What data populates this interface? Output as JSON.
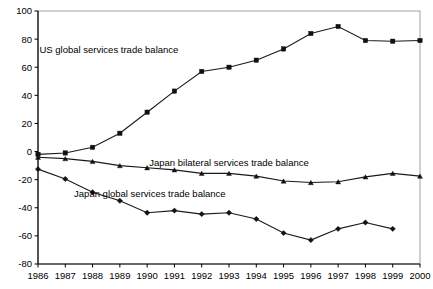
{
  "chart_data": {
    "type": "line",
    "title": "",
    "subtitle": "",
    "xlabel": "",
    "ylabel": "",
    "categories": [
      "1986",
      "1987",
      "1988",
      "1989",
      "1990",
      "1991",
      "1992",
      "1993",
      "1994",
      "1995",
      "1996",
      "1997",
      "1998",
      "1999",
      "2000"
    ],
    "x_tick_labels": [
      "1986",
      "1987",
      "1988",
      "1989",
      "1990",
      "1991",
      "1992",
      "1993",
      "1994",
      "1995",
      "1996",
      "1997",
      "1998",
      "1999",
      "2000"
    ],
    "y_tick_labels": [
      "100",
      "80",
      "60",
      "40",
      "20",
      "0",
      "-20",
      "-40",
      "-60",
      "-80"
    ],
    "y_ticks": [
      100,
      80,
      60,
      40,
      20,
      0,
      -20,
      -40,
      -60,
      -80
    ],
    "ylim": [
      -80,
      100
    ],
    "xlim": [
      "1986",
      "2000"
    ],
    "grid": false,
    "legend_position": "inline-annotations",
    "series": [
      {
        "name": "US global services trade balance",
        "marker": "square",
        "annotation": "US global services trade balance",
        "values": [
          -2,
          -1,
          3,
          13,
          28,
          43,
          57,
          60,
          65,
          73,
          84,
          89,
          79,
          78.5,
          79
        ]
      },
      {
        "name": "Japan bilateral services trade balance",
        "marker": "triangle",
        "annotation": "Japan bilateral services trade balance",
        "values": [
          -4,
          -5,
          -7,
          -10,
          -11.5,
          -13,
          -15.5,
          -15.5,
          -17.5,
          -21,
          -22,
          -21.5,
          -18,
          -15.5,
          -17.5
        ]
      },
      {
        "name": "Japan global services trade balance",
        "marker": "diamond",
        "annotation": "Japan global services trade balance",
        "values": [
          -12.5,
          -19.5,
          -29,
          -35,
          -43.5,
          -42,
          -44.5,
          -43.5,
          -48,
          -58,
          -63,
          -55,
          -50.5,
          -55,
          null
        ]
      }
    ],
    "annotations": [
      {
        "text": "US global services trade balance",
        "x_anchor": 1988.6,
        "y_anchor": 70
      },
      {
        "text": "Japan bilateral services trade balance",
        "x_anchor": 1993.0,
        "y_anchor": -10.5
      },
      {
        "text": "Japan global services trade balance",
        "x_anchor": 1990.1,
        "y_anchor": -32.5
      }
    ],
    "colors": {
      "line": "#1a1a1a",
      "marker": "#111111",
      "axis": "#000000",
      "plot_border": "#8a8a8a",
      "background": "#ffffff"
    }
  }
}
